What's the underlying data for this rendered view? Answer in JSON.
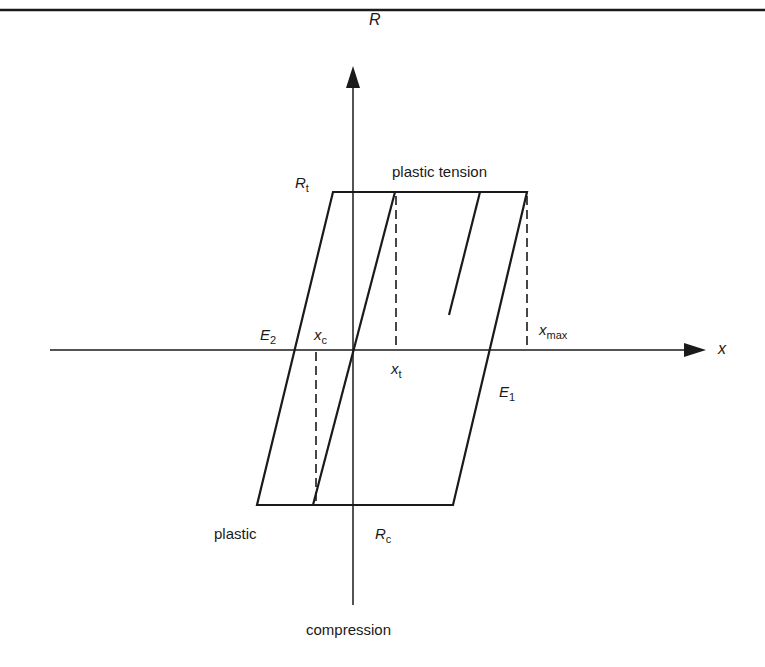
{
  "diagram": {
    "type": "elastic-perfectly-plastic hysteresis diagram",
    "axes": {
      "vertical": {
        "label": "R"
      },
      "horizontal": {
        "label": "x"
      }
    },
    "labels": {
      "R_t": {
        "main": "R",
        "sub": "t"
      },
      "R_c": {
        "main": "R",
        "sub": "c"
      },
      "E_1": {
        "main": "E",
        "sub": "1"
      },
      "E_2": {
        "main": "E",
        "sub": "2"
      },
      "x_c": {
        "main": "x",
        "sub": "c"
      },
      "x_t": {
        "main": "x",
        "sub": "t"
      },
      "x_max": {
        "main": "x",
        "sub": "max"
      },
      "plastic_tension": "plastic tension",
      "plastic": "plastic",
      "compression": "compression"
    },
    "colors": {
      "ink": "#1a1a1a",
      "background": "#ffffff"
    }
  }
}
